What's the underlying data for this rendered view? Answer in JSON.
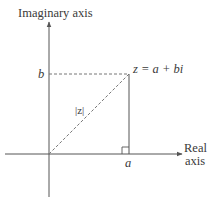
{
  "diagram": {
    "axes": {
      "vertical_label": "Imaginary axis",
      "horizontal_label_line1": "Real",
      "horizontal_label_line2": "axis"
    },
    "labels": {
      "point": "z = a + bi",
      "imag_component": "b",
      "real_component": "a",
      "modulus": "|z|"
    },
    "geometry": {
      "origin": [
        49,
        154
      ],
      "point": [
        129,
        74
      ],
      "x_axis": {
        "from": [
          5,
          154
        ],
        "to": [
          182,
          154
        ]
      },
      "y_axis": {
        "from": [
          49,
          197
        ],
        "to": [
          49,
          22
        ]
      },
      "right_angle_size": 7
    },
    "colors": {
      "line": "#555555",
      "dashed": "#777777",
      "text": "#3a3a3a",
      "background": "#ffffff"
    }
  }
}
